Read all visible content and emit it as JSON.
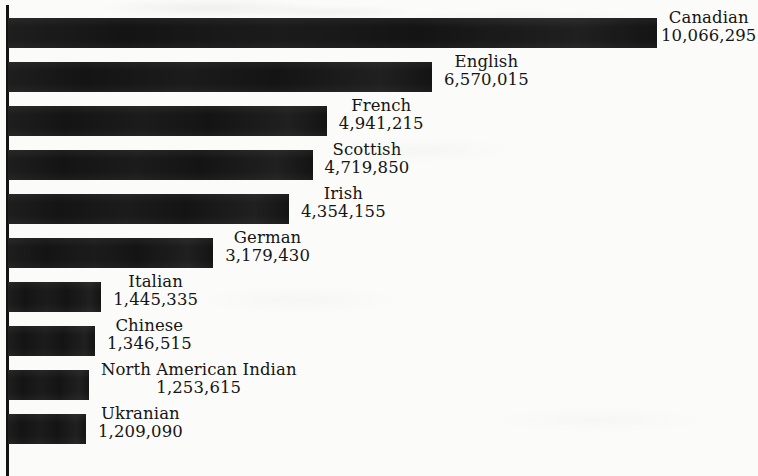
{
  "chart_data": {
    "type": "bar",
    "orientation": "horizontal",
    "title": "",
    "subtitle": "",
    "xlabel": "",
    "ylabel": "",
    "grid": false,
    "legend": null,
    "axis": {
      "category_axis": "vertical-left-spine",
      "value_axis_visible": false,
      "xlim": [
        0,
        10066295
      ],
      "tick_labels": []
    },
    "value_format": "comma-separated integers",
    "data_labels_position": "outside-end",
    "categories": [
      "Canadian",
      "English",
      "French",
      "Scottish",
      "Irish",
      "German",
      "Italian",
      "Chinese",
      "North American Indian",
      "Ukranian"
    ],
    "values": [
      10066295,
      6570015,
      4941215,
      4719850,
      4354155,
      3179430,
      1445335,
      1346515,
      1253615,
      1209090
    ],
    "value_labels": [
      "10,066,295",
      "6,570,015",
      "4,941,215",
      "4,719,850",
      "4,354,155",
      "3,179,430",
      "1,445,335",
      "1,346,515",
      "1,253,615",
      "1,209,090"
    ],
    "colors": {
      "bar": "#141414",
      "axis": "#131313",
      "text": "#151515",
      "background": "#fbfbf9"
    }
  },
  "bars": [
    {
      "label": "Canadian",
      "value_label": "10,066,295",
      "value": 10066295
    },
    {
      "label": "English",
      "value_label": "6,570,015",
      "value": 6570015
    },
    {
      "label": "French",
      "value_label": "4,941,215",
      "value": 4941215
    },
    {
      "label": "Scottish",
      "value_label": "4,719,850",
      "value": 4719850
    },
    {
      "label": "Irish",
      "value_label": "4,354,155",
      "value": 4354155
    },
    {
      "label": "German",
      "value_label": "3,179,430",
      "value": 3179430
    },
    {
      "label": "Italian",
      "value_label": "1,445,335",
      "value": 1445335
    },
    {
      "label": "Chinese",
      "value_label": "1,346,515",
      "value": 1346515
    },
    {
      "label": "North American Indian",
      "value_label": "1,253,615",
      "value": 1253615
    },
    {
      "label": "Ukranian",
      "value_label": "1,209,090",
      "value": 1209090
    }
  ],
  "layout": {
    "bar_height_px": 30,
    "bar_pitch_px": 44,
    "first_bar_top_px": 18,
    "bar_origin_x_px": 8,
    "px_per_unit": 6.452e-05,
    "label_gap_px": 12
  }
}
